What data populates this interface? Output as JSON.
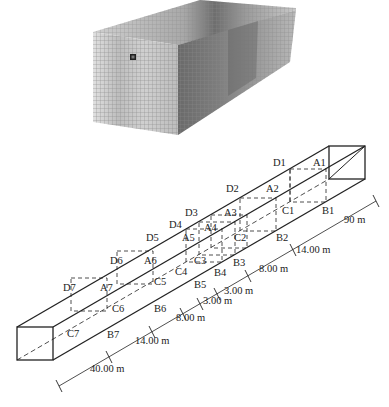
{
  "figure": {
    "top_panel": {
      "description": "3D finite element mesh model (grayscale contour)",
      "mesh_color": "#7a7a7a",
      "background": "#ffffff"
    },
    "bottom_panel": {
      "description": "Tunnel schematic with monitoring sections",
      "section_labels": {
        "A": [
          "A1",
          "A2",
          "A3",
          "A4",
          "A5",
          "A6",
          "A7"
        ],
        "B": [
          "B1",
          "B2",
          "B3",
          "B4",
          "B5",
          "B6",
          "B7"
        ],
        "C": [
          "C1",
          "C2",
          "C3",
          "C4",
          "C5",
          "C6",
          "C7"
        ],
        "D": [
          "D1",
          "D2",
          "D3",
          "D4",
          "D5",
          "D6",
          "D7"
        ]
      },
      "dimensions": {
        "d_end_right": "90 m",
        "d_b1_b2": "14.00 m",
        "d_b2_b3": "8.00 m",
        "d_b3_b4": "3.00 m",
        "d_b4_b5": "3.00 m",
        "d_b5_b6": "8.00 m",
        "d_b6_b7": "14.00 m",
        "d_end_left": "40.00 m"
      }
    }
  }
}
